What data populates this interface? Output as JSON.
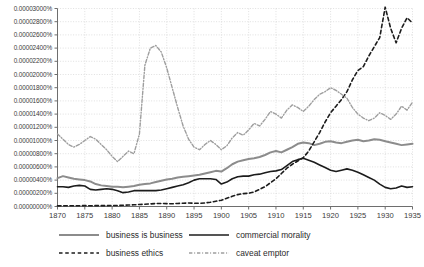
{
  "chart_data": {
    "type": "line",
    "title": "",
    "xlabel": "",
    "ylabel": "",
    "xlim": [
      1870,
      1935
    ],
    "ylim": [
      0.0,
      3e-07
    ],
    "grid": true,
    "legend_position": "bottom",
    "x_ticks": [
      1870,
      1875,
      1880,
      1885,
      1890,
      1895,
      1900,
      1905,
      1910,
      1915,
      1920,
      1925,
      1930,
      1935
    ],
    "x_tick_labels": [
      "1870",
      "1875",
      "1880",
      "1885",
      "1890",
      "1895",
      "1900",
      "1905",
      "1910",
      "1915",
      "1920",
      "1925",
      "1930",
      "1935"
    ],
    "y_ticks": [
      0.0,
      2e-08,
      4e-08,
      6e-08,
      8e-08,
      1e-07,
      1.2e-07,
      1.4e-07,
      1.6e-07,
      1.8e-07,
      2e-07,
      2.2e-07,
      2.4e-07,
      2.6e-07,
      2.8e-07,
      3e-07
    ],
    "y_tick_labels": [
      "0.00000000%",
      "0.00000200%",
      "0.00000400%",
      "0.00000600%",
      "0.00000800%",
      "0.00001000%",
      "0.00001200%",
      "0.00001400%",
      "0.00001600%",
      "0.00001800%",
      "0.00002000%",
      "0.00002200%",
      "0.00002400%",
      "0.00002600%",
      "0.00002800%",
      "0.00003000%"
    ],
    "x": [
      1870,
      1871,
      1872,
      1873,
      1874,
      1875,
      1876,
      1877,
      1878,
      1879,
      1880,
      1881,
      1882,
      1883,
      1884,
      1885,
      1886,
      1887,
      1888,
      1889,
      1890,
      1891,
      1892,
      1893,
      1894,
      1895,
      1896,
      1897,
      1898,
      1899,
      1900,
      1901,
      1902,
      1903,
      1904,
      1905,
      1906,
      1907,
      1908,
      1909,
      1910,
      1911,
      1912,
      1913,
      1914,
      1915,
      1916,
      1917,
      1918,
      1919,
      1920,
      1921,
      1922,
      1923,
      1924,
      1925,
      1926,
      1927,
      1928,
      1929,
      1930,
      1931,
      1932,
      1933,
      1934,
      1935
    ],
    "series": [
      {
        "name": "business is business",
        "color": "#8c8c8c",
        "style": "solid",
        "width": 2.0,
        "values": [
          4.3e-08,
          4.6e-08,
          4.4e-08,
          4.2e-08,
          4.1e-08,
          4e-08,
          3.8e-08,
          3.4e-08,
          3.2e-08,
          3.1e-08,
          3e-08,
          3e-08,
          2.9e-08,
          3e-08,
          3.1e-08,
          3.3e-08,
          3.4e-08,
          3.5e-08,
          3.7e-08,
          3.9e-08,
          4.1e-08,
          4.2e-08,
          4.4e-08,
          4.5e-08,
          4.6e-08,
          4.7e-08,
          4.8e-08,
          5e-08,
          5.2e-08,
          5.4e-08,
          5.3e-08,
          5.8e-08,
          6.4e-08,
          6.8e-08,
          7e-08,
          7.2e-08,
          7.3e-08,
          7.5e-08,
          7.8e-08,
          8.2e-08,
          8.4e-08,
          8.2e-08,
          8.6e-08,
          9e-08,
          9.5e-08,
          9.7e-08,
          9.6e-08,
          9.3e-08,
          9.5e-08,
          9.8e-08,
          9.9e-08,
          9.7e-08,
          9.6e-08,
          9.8e-08,
          1e-07,
          1.01e-07,
          9.9e-08,
          1e-07,
          1.02e-07,
          1.01e-07,
          9.9e-08,
          9.7e-08,
          9.5e-08,
          9.3e-08,
          9.4e-08,
          9.5e-08
        ]
      },
      {
        "name": "commercial morality",
        "color": "#1c1c1c",
        "style": "solid",
        "width": 1.6,
        "values": [
          3e-08,
          3e-08,
          2.9e-08,
          3.1e-08,
          3.2e-08,
          3.1e-08,
          2.6e-08,
          2.5e-08,
          2.6e-08,
          2.7e-08,
          2.6e-08,
          2.4e-08,
          2.1e-08,
          2.2e-08,
          2.4e-08,
          2.4e-08,
          2.4e-08,
          2.4e-08,
          2.4e-08,
          2.5e-08,
          2.7e-08,
          2.9e-08,
          3.1e-08,
          3.3e-08,
          3.6e-08,
          4e-08,
          4.2e-08,
          4.2e-08,
          4.2e-08,
          4.1e-08,
          3.4e-08,
          3.7e-08,
          4.2e-08,
          4.5e-08,
          4.6e-08,
          4.6e-08,
          4.8e-08,
          4.9e-08,
          5.1e-08,
          5.3e-08,
          5.4e-08,
          5.6e-08,
          6.2e-08,
          6.8e-08,
          7.1e-08,
          7.3e-08,
          7e-08,
          6.7e-08,
          6.3e-08,
          5.9e-08,
          5.5e-08,
          5.3e-08,
          5.5e-08,
          5.7e-08,
          5.5e-08,
          5.2e-08,
          4.8e-08,
          4.4e-08,
          4e-08,
          3.4e-08,
          2.9e-08,
          2.7e-08,
          2.8e-08,
          3.1e-08,
          2.9e-08,
          3e-08
        ]
      },
      {
        "name": "business ethics",
        "color": "#1c1c1c",
        "style": "dashed",
        "width": 1.6,
        "values": [
          1e-09,
          1.2e-09,
          1e-09,
          1.1e-09,
          1.2e-09,
          1.3e-09,
          1.2e-09,
          1.3e-09,
          1.4e-09,
          1.3e-09,
          1.5e-09,
          1.6e-09,
          1.8e-09,
          2.2e-09,
          2.6e-09,
          3e-09,
          3.4e-09,
          4e-09,
          4.4e-09,
          4.6e-09,
          4.3e-09,
          4.2e-09,
          4.6e-09,
          5e-09,
          5.2e-09,
          5e-09,
          4.8e-09,
          5.4e-09,
          6.5e-09,
          8e-09,
          9.5e-09,
          1.25e-08,
          1.55e-08,
          1.8e-08,
          1.95e-08,
          2e-08,
          2.2e-08,
          2.6e-08,
          3e-08,
          3.6e-08,
          4.2e-08,
          5e-08,
          5.8e-08,
          6.4e-08,
          6.9e-08,
          7.4e-08,
          8.4e-08,
          9.8e-08,
          1.12e-07,
          1.28e-07,
          1.42e-07,
          1.52e-07,
          1.62e-07,
          1.74e-07,
          1.92e-07,
          2.06e-07,
          2.12e-07,
          2.28e-07,
          2.42e-07,
          2.56e-07,
          3.02e-07,
          2.7e-07,
          2.48e-07,
          2.7e-07,
          2.86e-07,
          2.78e-07
        ]
      },
      {
        "name": "caveat emptor",
        "color": "#9e9e9e",
        "style": "dashdot",
        "width": 1.4,
        "values": [
          1.1e-07,
          1.02e-07,
          9.4e-08,
          9e-08,
          9.4e-08,
          1e-07,
          1.06e-07,
          1.02e-07,
          9.4e-08,
          8.6e-08,
          7.6e-08,
          6.8e-08,
          7.6e-08,
          8.4e-08,
          8e-08,
          1.1e-07,
          2.14e-07,
          2.4e-07,
          2.44e-07,
          2.34e-07,
          2.1e-07,
          1.8e-07,
          1.5e-07,
          1.22e-07,
          1.02e-07,
          9e-08,
          8.6e-08,
          9.4e-08,
          1e-07,
          9.4e-08,
          8.6e-08,
          9.2e-08,
          1.04e-07,
          1.12e-07,
          1.08e-07,
          1.16e-07,
          1.26e-07,
          1.22e-07,
          1.32e-07,
          1.44e-07,
          1.4e-07,
          1.34e-07,
          1.46e-07,
          1.54e-07,
          1.5e-07,
          1.44e-07,
          1.52e-07,
          1.62e-07,
          1.7e-07,
          1.74e-07,
          1.8e-07,
          1.76e-07,
          1.7e-07,
          1.64e-07,
          1.5e-07,
          1.4e-07,
          1.34e-07,
          1.3e-07,
          1.34e-07,
          1.42e-07,
          1.38e-07,
          1.32e-07,
          1.4e-07,
          1.52e-07,
          1.46e-07,
          1.58e-07
        ]
      }
    ]
  },
  "legend": {
    "items": [
      {
        "label": "business is business",
        "series": 0
      },
      {
        "label": "commercial morality",
        "series": 1
      },
      {
        "label": "business ethics",
        "series": 2
      },
      {
        "label": "caveat emptor",
        "series": 3
      }
    ]
  },
  "axes": {
    "axis_color": "#6e6e6e",
    "grid_color": "#d2d2d2"
  }
}
